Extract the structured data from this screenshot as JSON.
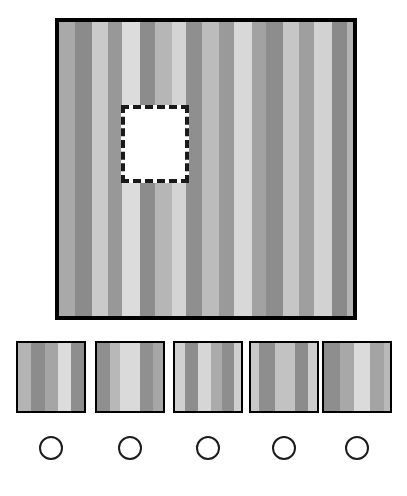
{
  "task": {
    "type": "pattern-completion",
    "title": "Pattern Completion Task",
    "instruction": "",
    "num_options": 5,
    "selected_option": null
  },
  "palette": {
    "background": "#ffffff",
    "border": "#000000",
    "dash_border": "#1a1a1a",
    "missing_fill": "#ffffff",
    "circle_stroke": "#1c1c1c",
    "gray_dark": "#8a8a8a",
    "gray_mid": "#a8a8a8",
    "gray_light": "#c8c8c8",
    "gray_lighter": "#dcdcdc"
  },
  "stimulus": {
    "name": "striped-square",
    "left": 55,
    "top": 18,
    "width": 302,
    "height": 302,
    "border_width": 4,
    "stripes": [
      {
        "width": 16,
        "color": "#a9a9a9"
      },
      {
        "width": 17,
        "color": "#8b8b8b"
      },
      {
        "width": 16,
        "color": "#cacaca"
      },
      {
        "width": 14,
        "color": "#989898"
      },
      {
        "width": 18,
        "color": "#dcdcdc"
      },
      {
        "width": 15,
        "color": "#8c8c8c"
      },
      {
        "width": 17,
        "color": "#b6b6b6"
      },
      {
        "width": 14,
        "color": "#d4d4d4"
      },
      {
        "width": 16,
        "color": "#8f8f8f"
      },
      {
        "width": 17,
        "color": "#bcbcbc"
      },
      {
        "width": 15,
        "color": "#9a9a9a"
      },
      {
        "width": 18,
        "color": "#d8d8d8"
      },
      {
        "width": 14,
        "color": "#a2a2a2"
      },
      {
        "width": 17,
        "color": "#8d8d8d"
      },
      {
        "width": 16,
        "color": "#c6c6c6"
      },
      {
        "width": 15,
        "color": "#9f9f9f"
      },
      {
        "width": 18,
        "color": "#d2d2d2"
      },
      {
        "width": 15,
        "color": "#8a8a8a"
      },
      {
        "width": 16,
        "color": "#b2b2b2"
      }
    ],
    "missing_region": {
      "name": "missing-piece",
      "left": 62,
      "top": 83,
      "width": 68,
      "height": 78,
      "style": "dashed",
      "fill": "#ffffff"
    }
  },
  "options": [
    {
      "id": "A",
      "left": 16,
      "stripes": [
        {
          "width": 13,
          "color": "#b4b4b4"
        },
        {
          "width": 14,
          "color": "#8c8c8c"
        },
        {
          "width": 13,
          "color": "#a5a5a5"
        },
        {
          "width": 13,
          "color": "#dcdcdc"
        },
        {
          "width": 13,
          "color": "#8e8e8e"
        }
      ]
    },
    {
      "id": "B",
      "left": 95,
      "stripes": [
        {
          "width": 13,
          "color": "#8f8f8f"
        },
        {
          "width": 10,
          "color": "#b8b8b8"
        },
        {
          "width": 20,
          "color": "#dadada"
        },
        {
          "width": 13,
          "color": "#909090"
        },
        {
          "width": 10,
          "color": "#a6a6a6"
        }
      ]
    },
    {
      "id": "C",
      "left": 173,
      "stripes": [
        {
          "width": 10,
          "color": "#d0d0d0"
        },
        {
          "width": 13,
          "color": "#8d8d8d"
        },
        {
          "width": 13,
          "color": "#d6d6d6"
        },
        {
          "width": 11,
          "color": "#ababab"
        },
        {
          "width": 12,
          "color": "#8e8e8e"
        },
        {
          "width": 7,
          "color": "#cfcfcf"
        }
      ]
    },
    {
      "id": "D",
      "left": 249,
      "stripes": [
        {
          "width": 8,
          "color": "#c8c8c8"
        },
        {
          "width": 16,
          "color": "#8e8e8e"
        },
        {
          "width": 20,
          "color": "#c2c2c2"
        },
        {
          "width": 13,
          "color": "#8c8c8c"
        },
        {
          "width": 9,
          "color": "#cdcdcd"
        }
      ]
    },
    {
      "id": "E",
      "left": 322,
      "stripes": [
        {
          "width": 16,
          "color": "#8e8e8e"
        },
        {
          "width": 14,
          "color": "#a8a8a8"
        },
        {
          "width": 16,
          "color": "#dbdbdb"
        },
        {
          "width": 14,
          "color": "#a4a4a4"
        },
        {
          "width": 6,
          "color": "#b9b9b9"
        }
      ]
    }
  ],
  "answer_circles": [
    {
      "id": "A",
      "left": 39,
      "selected": false
    },
    {
      "id": "B",
      "left": 118,
      "selected": false
    },
    {
      "id": "C",
      "left": 196,
      "selected": false
    },
    {
      "id": "D",
      "left": 272,
      "selected": false
    },
    {
      "id": "E",
      "left": 345,
      "selected": false
    }
  ]
}
